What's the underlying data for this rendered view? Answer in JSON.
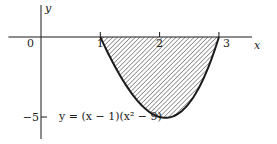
{
  "chart_data": {
    "type": "area",
    "title": "",
    "xlabel": "x",
    "ylabel": "y",
    "xlim": [
      -0.55,
      3.6
    ],
    "ylim": [
      -6.1,
      2.3
    ],
    "x_ticks": [
      {
        "value": 0,
        "label": "0"
      },
      {
        "value": 1,
        "label": "1"
      },
      {
        "value": 2,
        "label": "2"
      },
      {
        "value": 3,
        "label": "3"
      }
    ],
    "y_ticks": [
      {
        "value": -5,
        "label": "−5"
      }
    ],
    "curve": {
      "equation_label": "y = (x − 1)(x² − 9)",
      "function": "(x-1)*(x^2-9)",
      "domain": [
        1,
        3
      ],
      "points": [
        {
          "x": 1.0,
          "y": 0.0
        },
        {
          "x": 1.25,
          "y": -1.86
        },
        {
          "x": 1.5,
          "y": -3.38
        },
        {
          "x": 1.75,
          "y": -4.45
        },
        {
          "x": 2.0,
          "y": -5.0
        },
        {
          "x": 2.2,
          "y": -5.06
        },
        {
          "x": 2.5,
          "y": -4.13
        },
        {
          "x": 2.75,
          "y": -2.53
        },
        {
          "x": 3.0,
          "y": 0.0
        }
      ]
    },
    "shaded_region": {
      "description": "Region between the curve and the x-axis from x = 1 to x = 3",
      "x_from": 1,
      "x_to": 3,
      "fill": "diagonal-hatch"
    },
    "grid": false,
    "legend": "none"
  }
}
